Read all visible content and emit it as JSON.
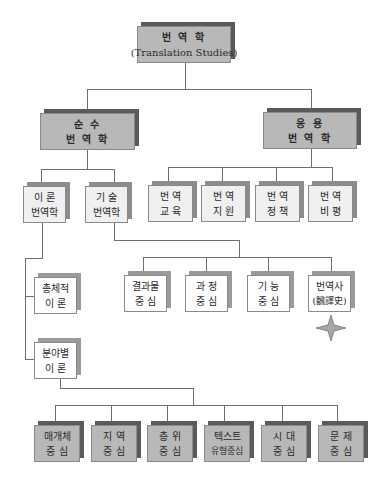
{
  "diagram": {
    "root": {
      "line1": "번 역 학",
      "line2": "(Translation Studies)"
    },
    "level1": {
      "pure": {
        "line1": "순 수",
        "line2": "번 역 학"
      },
      "applied": {
        "line1": "응 용",
        "line2": "번 역 학"
      }
    },
    "pure_children": [
      {
        "line1": "이 론",
        "line2": "번역학"
      },
      {
        "line1": "기 술",
        "line2": "번역학"
      }
    ],
    "applied_children": [
      {
        "line1": "번 역",
        "line2": "교 육"
      },
      {
        "line1": "번 역",
        "line2": "지 원"
      },
      {
        "line1": "번 역",
        "line2": "정 책"
      },
      {
        "line1": "번 역",
        "line2": "비 평"
      }
    ],
    "theory_children": [
      {
        "line1": "총체적",
        "line2": "이 론"
      },
      {
        "line1": "분야별",
        "line2": "이 론"
      }
    ],
    "descriptive_children": [
      {
        "line1": "결과물",
        "line2": "중 심"
      },
      {
        "line1": "과 정",
        "line2": "중 심"
      },
      {
        "line1": "기 능",
        "line2": "중 심"
      },
      {
        "line1": "번역사",
        "line2": "(飜譯史)"
      }
    ],
    "partial_theory_children": [
      {
        "line1": "매개체",
        "line2": "중 심"
      },
      {
        "line1": "지 역",
        "line2": "중 심"
      },
      {
        "line1": "층 위",
        "line2": "중 심"
      },
      {
        "line1": "텍스트",
        "line2": "유형중심"
      },
      {
        "line1": "시 대",
        "line2": "중 심"
      },
      {
        "line1": "문 제",
        "line2": "중 심"
      }
    ],
    "highlight_marker": "four-point-star",
    "colors": {
      "dark_box": "#b8b8b8",
      "light_box": "#f0f0f0",
      "line": "#6e6e6e",
      "star": "#a8a8a8"
    }
  }
}
